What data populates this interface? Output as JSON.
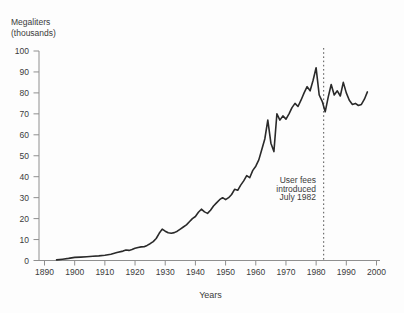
{
  "chart_data": {
    "type": "line",
    "title": "",
    "ylabel": "Megaliters (thousands)",
    "ylabel_lines": "Megaliters\n(thousands)",
    "xlabel": "Years",
    "xlim": [
      1890,
      2000
    ],
    "ylim": [
      0,
      100
    ],
    "x_ticks": [
      1890,
      1900,
      1910,
      1920,
      1930,
      1940,
      1950,
      1960,
      1970,
      1980,
      1990,
      2000
    ],
    "y_ticks": [
      0,
      10,
      20,
      30,
      40,
      50,
      60,
      70,
      80,
      90,
      100
    ],
    "grid": false,
    "legend": "none",
    "annotation": {
      "text": "User fees\nintroduced\nJuly 1982",
      "year": 1982.5,
      "line_style": "dotted-vertical"
    },
    "series": [
      {
        "name": "megaliters-thousands",
        "points": [
          [
            1894,
            0.3
          ],
          [
            1896,
            0.6
          ],
          [
            1898,
            1
          ],
          [
            1900,
            1.5
          ],
          [
            1902,
            1.6
          ],
          [
            1904,
            1.8
          ],
          [
            1906,
            2
          ],
          [
            1908,
            2.2
          ],
          [
            1910,
            2.5
          ],
          [
            1912,
            3
          ],
          [
            1914,
            3.8
          ],
          [
            1916,
            4.5
          ],
          [
            1917,
            5
          ],
          [
            1918,
            4.8
          ],
          [
            1919,
            5.2
          ],
          [
            1920,
            5.8
          ],
          [
            1921,
            6.2
          ],
          [
            1922,
            6.5
          ],
          [
            1923,
            6.6
          ],
          [
            1924,
            7.2
          ],
          [
            1925,
            8
          ],
          [
            1926,
            9
          ],
          [
            1927,
            10.5
          ],
          [
            1928,
            13
          ],
          [
            1929,
            15
          ],
          [
            1930,
            14
          ],
          [
            1931,
            13.2
          ],
          [
            1932,
            13
          ],
          [
            1933,
            13.3
          ],
          [
            1934,
            14
          ],
          [
            1935,
            15
          ],
          [
            1936,
            16
          ],
          [
            1937,
            17
          ],
          [
            1938,
            18.5
          ],
          [
            1939,
            20
          ],
          [
            1940,
            21
          ],
          [
            1941,
            23
          ],
          [
            1942,
            24.5
          ],
          [
            1943,
            23.2
          ],
          [
            1944,
            22.5
          ],
          [
            1945,
            24
          ],
          [
            1946,
            26
          ],
          [
            1947,
            27.5
          ],
          [
            1948,
            29
          ],
          [
            1949,
            30
          ],
          [
            1950,
            29
          ],
          [
            1951,
            30
          ],
          [
            1952,
            31.5
          ],
          [
            1953,
            34
          ],
          [
            1954,
            33.5
          ],
          [
            1955,
            36
          ],
          [
            1956,
            38
          ],
          [
            1957,
            40.5
          ],
          [
            1958,
            39.5
          ],
          [
            1959,
            43
          ],
          [
            1960,
            45
          ],
          [
            1961,
            48
          ],
          [
            1962,
            53
          ],
          [
            1963,
            58
          ],
          [
            1964,
            67
          ],
          [
            1965,
            56
          ],
          [
            1966,
            52
          ],
          [
            1967,
            70
          ],
          [
            1968,
            67
          ],
          [
            1969,
            69
          ],
          [
            1970,
            67.5
          ],
          [
            1971,
            70
          ],
          [
            1972,
            73
          ],
          [
            1973,
            75
          ],
          [
            1974,
            73.5
          ],
          [
            1975,
            76.5
          ],
          [
            1976,
            80
          ],
          [
            1977,
            83
          ],
          [
            1978,
            81
          ],
          [
            1979,
            86
          ],
          [
            1980,
            92
          ],
          [
            1981,
            79
          ],
          [
            1982,
            76
          ],
          [
            1983,
            71
          ],
          [
            1984,
            78
          ],
          [
            1985,
            84
          ],
          [
            1986,
            79
          ],
          [
            1987,
            81
          ],
          [
            1988,
            78.5
          ],
          [
            1989,
            85
          ],
          [
            1990,
            80
          ],
          [
            1991,
            76.5
          ],
          [
            1992,
            74.5
          ],
          [
            1993,
            75
          ],
          [
            1994,
            74
          ],
          [
            1995,
            74.5
          ],
          [
            1996,
            77
          ],
          [
            1997,
            80.5
          ]
        ]
      }
    ],
    "colors": {
      "line": "#2a2a2a",
      "axis": "#8f8f8f",
      "text": "#3b3b3b",
      "dotted": "#555555",
      "background": "#fdfdfd"
    }
  }
}
